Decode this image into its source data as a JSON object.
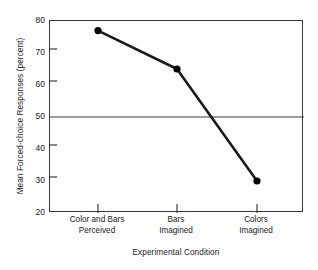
{
  "chart_data": {
    "type": "line",
    "title": "",
    "xlabel": "Experimental Condition",
    "ylabel": "Mean Forced-choice Responses (percent)",
    "categories": [
      "Color and Bars Perceived",
      "Bars Imagined",
      "Colors Imagined"
    ],
    "category_lines": [
      [
        "Color and Bars",
        "Perceived"
      ],
      [
        "Bars",
        "Imagined"
      ],
      [
        "Colors",
        "Imagined"
      ]
    ],
    "values": [
      77,
      65,
      30
    ],
    "ylim": [
      20,
      80
    ],
    "yticks": [
      80,
      70,
      60,
      50,
      40,
      30,
      20
    ],
    "ytick_labels": [
      "80",
      "70",
      "60",
      "50",
      "40",
      "30",
      "20"
    ],
    "grid": false,
    "reference_line": {
      "value": 50,
      "label": "50 percent chance level"
    },
    "legend": null,
    "marker": "filled-circle",
    "colors": {
      "line": "#1a1a1a",
      "marker": "#000000",
      "axis": "#3b3b3b",
      "reference_line": "#3b3b3b",
      "background": "#ffffff"
    }
  }
}
